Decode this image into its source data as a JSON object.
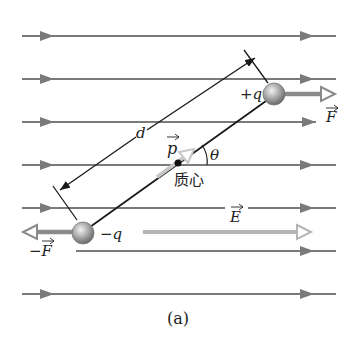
{
  "figure": {
    "caption": "(a)",
    "colors": {
      "field_line": "#7a7a7a",
      "dipole_rod": "#1a1a1a",
      "force_arrow": "#8a8a8a",
      "p_arrow": "#c8c8c8",
      "e_arrow": "#b5b5b5",
      "ball": "#9a9a9a",
      "text": "#222222"
    },
    "field_lines_y": [
      36,
      79,
      122,
      165,
      208,
      251,
      294
    ],
    "labels": {
      "positive_charge": "+q",
      "negative_charge": "−q",
      "force": "F",
      "negative_force": "−F",
      "dipole_moment": "p",
      "field": "E",
      "angle": "θ",
      "separation": "d",
      "center_of_mass": "质心"
    }
  }
}
